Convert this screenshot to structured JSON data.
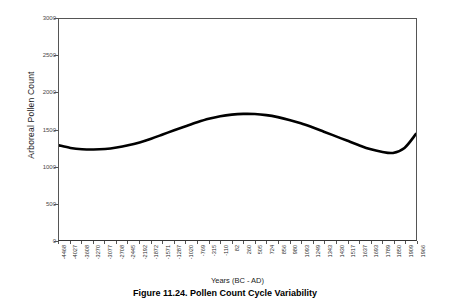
{
  "chart_data": {
    "type": "line",
    "title": "",
    "xlabel": "Years (BC - AD)",
    "ylabel": "Arboreal Pollen Count",
    "ylim": [
      0,
      3000
    ],
    "yticks": [
      0,
      500,
      1000,
      1500,
      2000,
      2500,
      3000
    ],
    "grid": false,
    "legend": "none",
    "line_color": "#000000",
    "line_width": 2.6,
    "categories": [
      "-4468",
      "-4027",
      "-3608",
      "-3270",
      "-3077",
      "-2708",
      "-2445",
      "-2192",
      "-1872",
      "-1571",
      "-1287",
      "-1020",
      "-769",
      "-315",
      "-110",
      "82",
      "260",
      "505",
      "724",
      "856",
      "980",
      "1093",
      "1249",
      "1343",
      "1430",
      "1517",
      "1637",
      "1693",
      "1789",
      "1850",
      "1909",
      "1966"
    ],
    "series": [
      {
        "name": "Arboreal Pollen Count",
        "values": [
          1285,
          1250,
          1232,
          1228,
          1235,
          1255,
          1285,
          1325,
          1375,
          1432,
          1490,
          1545,
          1598,
          1645,
          1680,
          1702,
          1712,
          1710,
          1695,
          1668,
          1630,
          1585,
          1530,
          1470,
          1410,
          1350,
          1290,
          1235,
          1198,
          1182,
          1250,
          1440
        ]
      }
    ]
  },
  "axes": {
    "y_title": "Arboreal Pollen Count",
    "x_title": "Years (BC - AD)",
    "y_tick_labels": [
      "3000",
      "2500",
      "2000",
      "1500",
      "1000",
      "500",
      "0"
    ]
  },
  "caption": {
    "text": "Figure 11.24. Pollen Count Cycle Variability"
  },
  "colors": {
    "line": "#000000",
    "frame": "#555555",
    "axis_text": "#2b2b2b",
    "background": "#ffffff"
  }
}
